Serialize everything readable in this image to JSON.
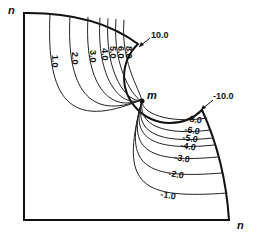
{
  "corner_labels": {
    "top_left": "n",
    "bottom_right": "n",
    "point": "m"
  },
  "callouts": {
    "top": "10.0",
    "right": "-10.0"
  },
  "positive_contours": [
    "1.0",
    "2.0",
    "3.0",
    "4.0",
    "5.0",
    "6.0",
    "8.0"
  ],
  "negative_contours": [
    "-8.0",
    "-6.0",
    "-5.0",
    "-4.0",
    "-3.0",
    "-2.0",
    "-1.0"
  ]
}
